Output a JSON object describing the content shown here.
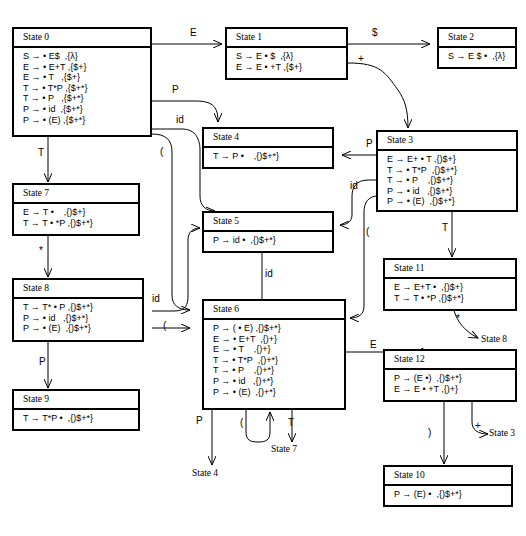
{
  "diagram": {
    "states": [
      {
        "id": "state0",
        "name": "State 0",
        "items": [
          "S → • E$  ,{λ}",
          "E → • E+T ,{$+}",
          "E → • T   ,{$+}",
          "T → • T*P ,{$+*}",
          "T → • P   ,{$+*}",
          "P → • id  ,{$+*}",
          "P → • (E) ,{$+*}"
        ]
      },
      {
        "id": "state1",
        "name": "State 1",
        "items": [
          "S → E • $  ,{λ}",
          "E → E • +T ,{$+}"
        ]
      },
      {
        "id": "state2",
        "name": "State 2",
        "items": [
          "S → E $ •  ,{λ}"
        ]
      },
      {
        "id": "state3",
        "name": "State 3",
        "items": [
          "E → E+ • T ,{)$+}",
          "T → • T*P  ,{)$+*}",
          "T → • P    ,{)$+*}",
          "P → • id   ,{)$+*}",
          "P → • (E)  ,{)$+*}"
        ]
      },
      {
        "id": "state4",
        "name": "State 4",
        "items": [
          "T → P •    ,{)$+*}"
        ]
      },
      {
        "id": "state5",
        "name": "State 5",
        "items": [
          "P → id •  ,{)$+*}"
        ]
      },
      {
        "id": "state6",
        "name": "State 6",
        "items": [
          "P → ( • E) ,{)$+*}",
          "E → • E+T  ,{)+}",
          "E → • T    ,{)+}",
          "T → • T*P  ,{)+*}",
          "T → • P    ,{)+*}",
          "P → • id   ,{)+*}",
          "P → • (E)  ,{)+*}"
        ]
      },
      {
        "id": "state7",
        "name": "State 7",
        "items": [
          "E → T •    ,{)$+}",
          "T → T • *P ,{)$+*}"
        ]
      },
      {
        "id": "state8",
        "name": "State 8",
        "items": [
          "T → T* • P ,{)$+*}",
          "P → • id   ,{)$+*}",
          "P → • (E)  ,{)$+*}"
        ]
      },
      {
        "id": "state9",
        "name": "State 9",
        "items": [
          "T → T*P •  ,{)$+*}"
        ]
      },
      {
        "id": "state10",
        "name": "State 10",
        "items": [
          "P → (E) •  ,{)$+*}"
        ]
      },
      {
        "id": "state11",
        "name": "State 11",
        "items": [
          "E → E+T •  ,{)$+}",
          "T → T • *P ,{)$+*}"
        ]
      },
      {
        "id": "state12",
        "name": "State 12",
        "items": [
          "P → (E •)  ,{)$+*}",
          "E → E • +T ,{)+}"
        ]
      }
    ],
    "edge_labels": [
      {
        "id": "e_0_1",
        "text": "E"
      },
      {
        "id": "e_1_2",
        "text": "$"
      },
      {
        "id": "e_1_3",
        "text": "+"
      },
      {
        "id": "e_0_4",
        "text": "P"
      },
      {
        "id": "e_0_5",
        "text": "id"
      },
      {
        "id": "e_0_6",
        "text": "("
      },
      {
        "id": "e_0_7",
        "text": "T"
      },
      {
        "id": "e_7_8",
        "text": "*"
      },
      {
        "id": "e_8_9",
        "text": "P"
      },
      {
        "id": "e_3_4",
        "text": "P"
      },
      {
        "id": "e_3_5",
        "text": "id"
      },
      {
        "id": "e_3_6",
        "text": "("
      },
      {
        "id": "e_3_11",
        "text": "T"
      },
      {
        "id": "e_8_5",
        "text": "id"
      },
      {
        "id": "e_8_6",
        "text": "("
      },
      {
        "id": "e_6_5",
        "text": "id"
      },
      {
        "id": "e_6_12",
        "text": "E"
      },
      {
        "id": "e_6_4",
        "text": "P"
      },
      {
        "id": "e_6_6",
        "text": "("
      },
      {
        "id": "e_6_7",
        "text": "T"
      },
      {
        "id": "e_11_8",
        "text": "*"
      },
      {
        "id": "e_12_10",
        "text": ")"
      },
      {
        "id": "e_12_3",
        "text": "+"
      }
    ],
    "reference_labels": [
      {
        "id": "ref_state8",
        "text": "State 8"
      },
      {
        "id": "ref_state3",
        "text": "State 3"
      },
      {
        "id": "ref_state7",
        "text": "State 7"
      },
      {
        "id": "ref_state4",
        "text": "State 4"
      }
    ]
  }
}
